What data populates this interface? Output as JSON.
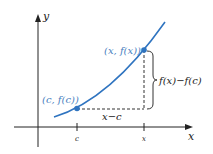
{
  "diagram": {
    "axes": {
      "x_label": "x",
      "y_label": "y"
    },
    "ticks": {
      "c_label": "c",
      "x_label": "x"
    },
    "points": {
      "left_label": "(c, f(c))",
      "right_label": "(x, f(x))"
    },
    "measurements": {
      "horizontal_label": "x−c",
      "vertical_label": "f(x)−f(c)"
    },
    "colors": {
      "curve": "#2f74c0",
      "point": "#2f74c0",
      "point_label": "#4a7fc0",
      "axis": "#222222",
      "dashed": "#333333"
    }
  }
}
